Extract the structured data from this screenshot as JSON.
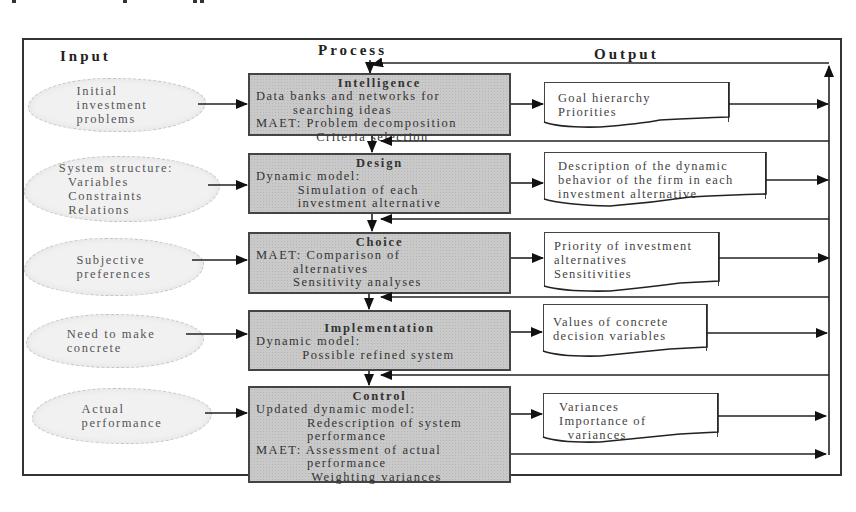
{
  "header_fragment": "p   r   e   r   p   r   r   a   p   p",
  "columns": {
    "input": "Input",
    "process": "Process",
    "output": "Output"
  },
  "stages": [
    {
      "input": "Initial\ninvestment\nproblems",
      "process_title": "Intelligence",
      "process_lines": [
        "Data banks and networks for",
        "        searching ideas",
        "MAET: Problem decomposition",
        "             Criteria selection"
      ],
      "output_lines": [
        "Goal hierarchy",
        "Priorities"
      ]
    },
    {
      "input": "System structure:\n  Variables\n  Constraints\n  Relations",
      "process_title": "Design",
      "process_lines": [
        "Dynamic model:",
        "         Simulation of each",
        "         investment alternative"
      ],
      "output_lines": [
        "Description of the dynamic",
        "behavior of the firm in each",
        "investment alternative"
      ]
    },
    {
      "input": "Subjective\npreferences",
      "process_title": "Choice",
      "process_lines": [
        "MAET: Comparison of",
        "        alternatives",
        "        Sensitivity analyses"
      ],
      "output_lines": [
        "Priority of investment",
        "alternatives",
        "",
        "Sensitivities"
      ]
    },
    {
      "input": "Need to make\nconcrete",
      "process_title": "Implementation",
      "process_lines": [
        "Dynamic model:",
        "          Possible refined system"
      ],
      "output_lines": [
        "Values of concrete",
        "decision variables"
      ]
    },
    {
      "input": "Actual\nperformance",
      "process_title": "Control",
      "process_lines": [
        "Updated dynamic model:",
        "           Redescription of system",
        "           performance",
        "MAET: Assessment of actual",
        "           performance",
        "            Weighting variances"
      ],
      "output_lines": [
        "Variances",
        "Importance of",
        "  variances"
      ]
    }
  ],
  "colors": {
    "process_fill": "#c9c9c9",
    "cloud_fill": "#f1f1f1",
    "line": "#222222"
  }
}
